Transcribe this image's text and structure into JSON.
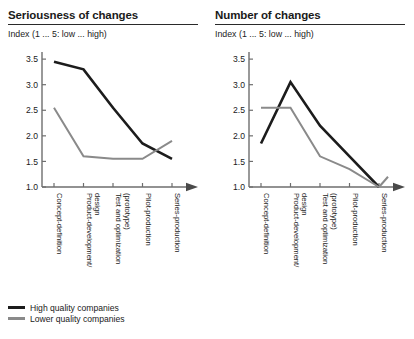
{
  "panels": [
    {
      "title": "Seriousness of changes",
      "subtitle": "Index (1 ... 5: low ... high)"
    },
    {
      "title": "Number of changes",
      "subtitle": "Index (1 ... 5: low ... high)"
    }
  ],
  "legend": {
    "items": [
      {
        "label": "High quality companies",
        "color": "#1c1c1c"
      },
      {
        "label": "Lower quality companies",
        "color": "#8a8a8a"
      }
    ]
  },
  "chart_data": [
    {
      "type": "line",
      "title": "Seriousness of changes",
      "subtitle": "Index (1 ... 5: low ... high)",
      "xlabel": "",
      "ylabel": "Index (1 ... 5: low ... high)",
      "categories": [
        "Concept-definition",
        "Product-development/ design",
        "Test and optimization (prototype)",
        "Pilot-production",
        "Series-production"
      ],
      "yticks": [
        1.0,
        1.5,
        2.0,
        2.5,
        3.0,
        3.5
      ],
      "yticklabels": [
        "1.0",
        "1.5",
        "2.0",
        "2.5",
        "3.0",
        "3.5"
      ],
      "ylim": [
        1.0,
        3.6
      ],
      "grid": false,
      "legend_position": "below-figure",
      "series": [
        {
          "name": "High quality companies",
          "color": "#1c1c1c",
          "values": [
            3.45,
            3.3,
            2.55,
            1.85,
            1.55
          ]
        },
        {
          "name": "Lower quality companies",
          "color": "#8a8a8a",
          "values": [
            2.55,
            1.6,
            1.55,
            1.55,
            1.9
          ]
        }
      ]
    },
    {
      "type": "line",
      "title": "Number of changes",
      "subtitle": "Index (1 ... 5: low ... high)",
      "xlabel": "",
      "ylabel": "Index (1 ... 5: low ... high)",
      "categories": [
        "Concept-definition",
        "Product-development/ design",
        "Test and optimization (prototype)",
        "Pilot-production",
        "Series-production"
      ],
      "yticks": [
        1.0,
        1.5,
        2.0,
        2.5,
        3.0,
        3.5
      ],
      "yticklabels": [
        "1.0",
        "1.5",
        "2.0",
        "2.5",
        "3.0",
        "3.5"
      ],
      "ylim": [
        1.0,
        3.6
      ],
      "grid": false,
      "legend_position": "below-figure",
      "series": [
        {
          "name": "High quality companies",
          "color": "#1c1c1c",
          "values": [
            1.85,
            3.05,
            2.2,
            1.6,
            1.0
          ]
        },
        {
          "name": "Lower quality companies",
          "color": "#8a8a8a",
          "values": [
            2.55,
            2.55,
            1.6,
            1.35,
            1.0
          ]
        }
      ],
      "annotations": [
        {
          "text": "gray line ticks up slightly after final category",
          "value": 1.2
        }
      ]
    }
  ]
}
